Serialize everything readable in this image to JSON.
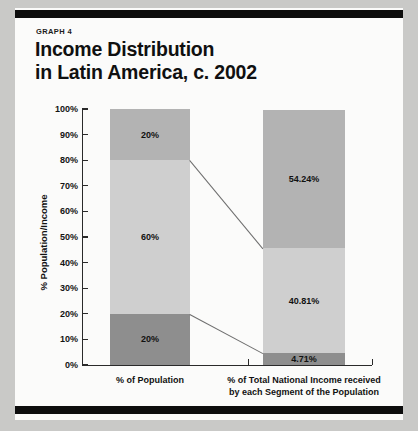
{
  "figure": {
    "kicker": "GRAPH 4",
    "title_line1": "Income Distribution",
    "title_line2": "in Latin America, c. 2002"
  },
  "chart_data": {
    "type": "bar",
    "subtype": "stacked-bar-100",
    "title": "Income Distribution in Latin America, c. 2002",
    "xlabel": "",
    "ylabel": "% Population/Income",
    "ylim": [
      0,
      100
    ],
    "yticks": [
      "0%",
      "10%",
      "20%",
      "30%",
      "40%",
      "50%",
      "60%",
      "70%",
      "80%",
      "90%",
      "100%"
    ],
    "ytick_values": [
      0,
      10,
      20,
      30,
      40,
      50,
      60,
      70,
      80,
      90,
      100
    ],
    "grid": false,
    "legend": "none",
    "categories": [
      "% of Population",
      "% of Total National Income received by each Segment of the Population"
    ],
    "category_labels": [
      {
        "line1": "% of Population",
        "line2": ""
      },
      {
        "line1": "% of Total National Income received",
        "line2": "by each Segment of the Population"
      }
    ],
    "series": [
      {
        "name": "Poorest segment",
        "values": [
          20,
          4.71
        ],
        "labels": [
          "20%",
          "4.71%"
        ],
        "color": "#8e8e8e"
      },
      {
        "name": "Middle segment",
        "values": [
          60,
          40.81
        ],
        "labels": [
          "60%",
          "40.81%"
        ],
        "color": "#cfcfcf"
      },
      {
        "name": "Richest segment",
        "values": [
          20,
          54.24
        ],
        "labels": [
          "20%",
          "54.24%"
        ],
        "color": "#b3b3b3"
      }
    ],
    "bars": [
      {
        "category": "% of Population",
        "segments": [
          {
            "label": "20%",
            "value": 20,
            "tone": "dark"
          },
          {
            "label": "60%",
            "value": 60,
            "tone": "light"
          },
          {
            "label": "20%",
            "value": 20,
            "tone": "mid"
          }
        ]
      },
      {
        "category": "% of Total National Income received by each Segment of the Population",
        "segments": [
          {
            "label": "4.71%",
            "value": 4.71,
            "tone": "dark"
          },
          {
            "label": "40.81%",
            "value": 40.81,
            "tone": "light"
          },
          {
            "label": "54.24%",
            "value": 54.24,
            "tone": "mid"
          }
        ]
      }
    ],
    "connectors": [
      {
        "from_bar": 0,
        "from_value": 80,
        "to_bar": 1,
        "to_value": 45.52
      },
      {
        "from_bar": 0,
        "from_value": 20,
        "to_bar": 1,
        "to_value": 4.71
      }
    ],
    "colors": {
      "segment_dark": "#8e8e8e",
      "segment_mid": "#b3b3b3",
      "segment_light": "#cfcfcf",
      "axis": "#2a2a2a",
      "rule": "#0d0d0d",
      "page": "#fbfbfa",
      "backdrop": "#c9c9c7"
    }
  }
}
